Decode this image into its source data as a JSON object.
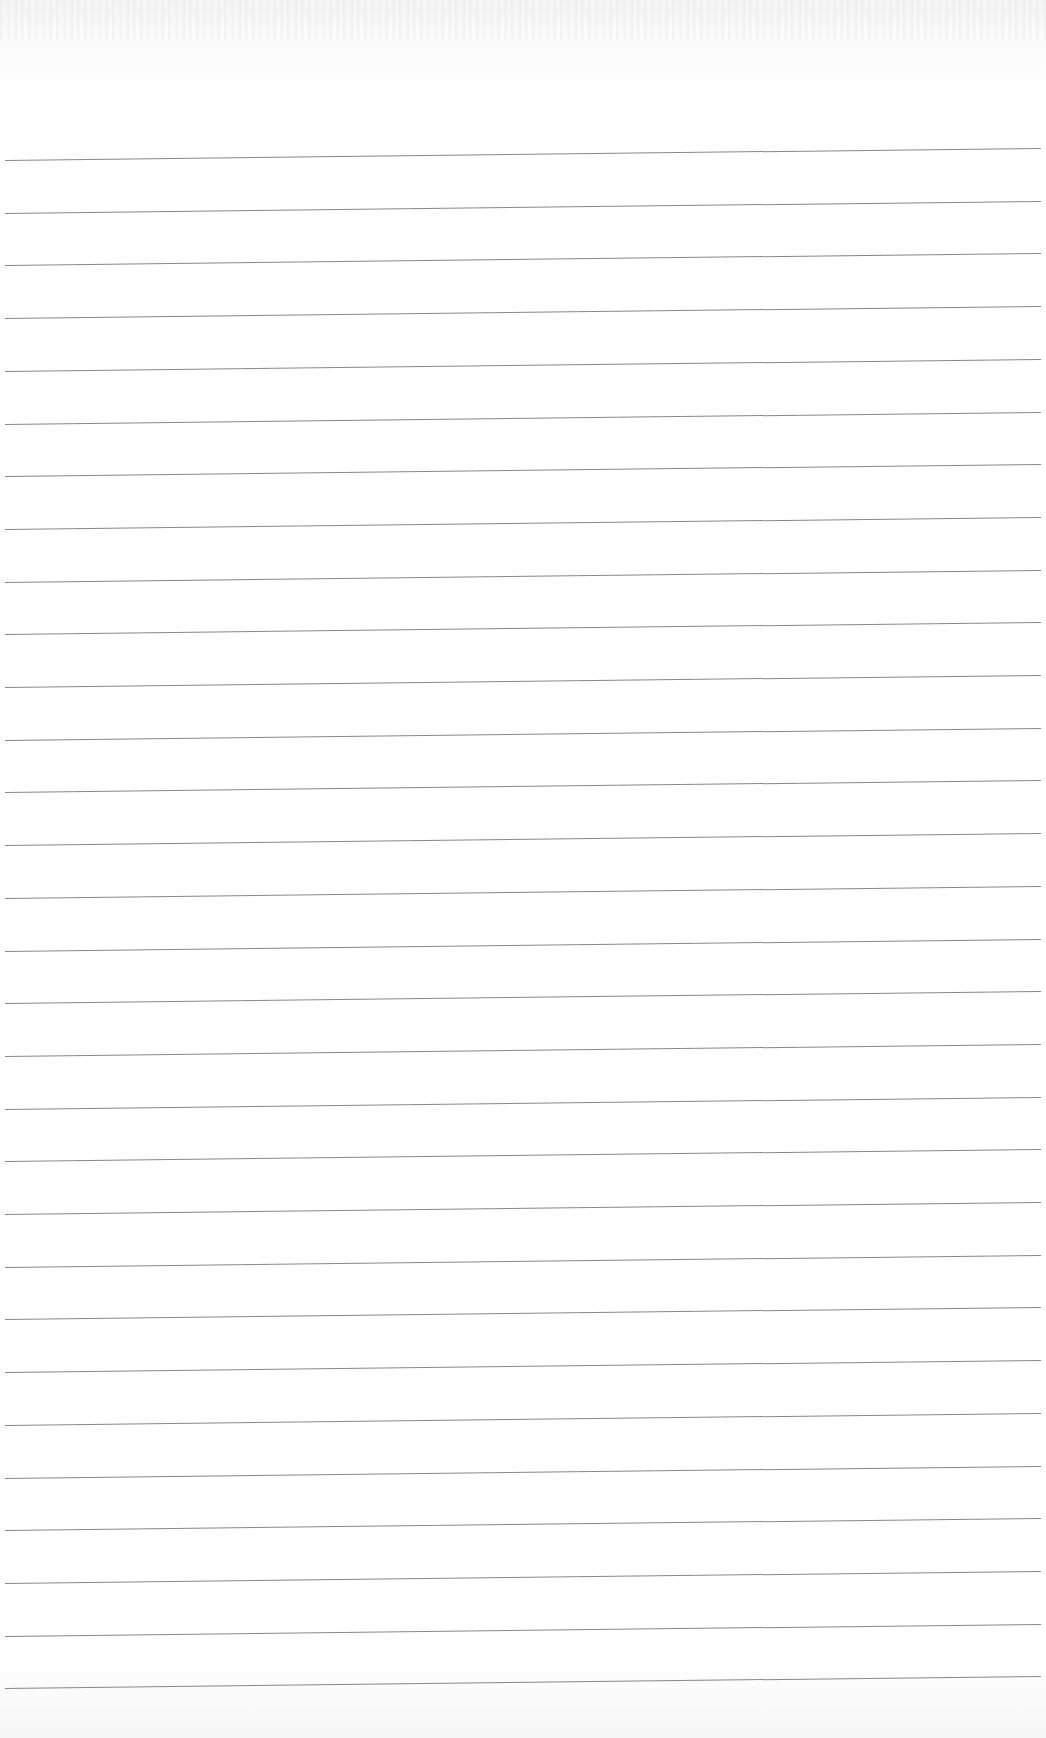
{
  "document": {
    "type": "lined-paper",
    "header_text": "",
    "line_count": 30,
    "first_line_y": 160,
    "line_spacing": 52.7,
    "line_color": "#7a7a7a",
    "paper_color": "#ffffff",
    "lines": []
  }
}
